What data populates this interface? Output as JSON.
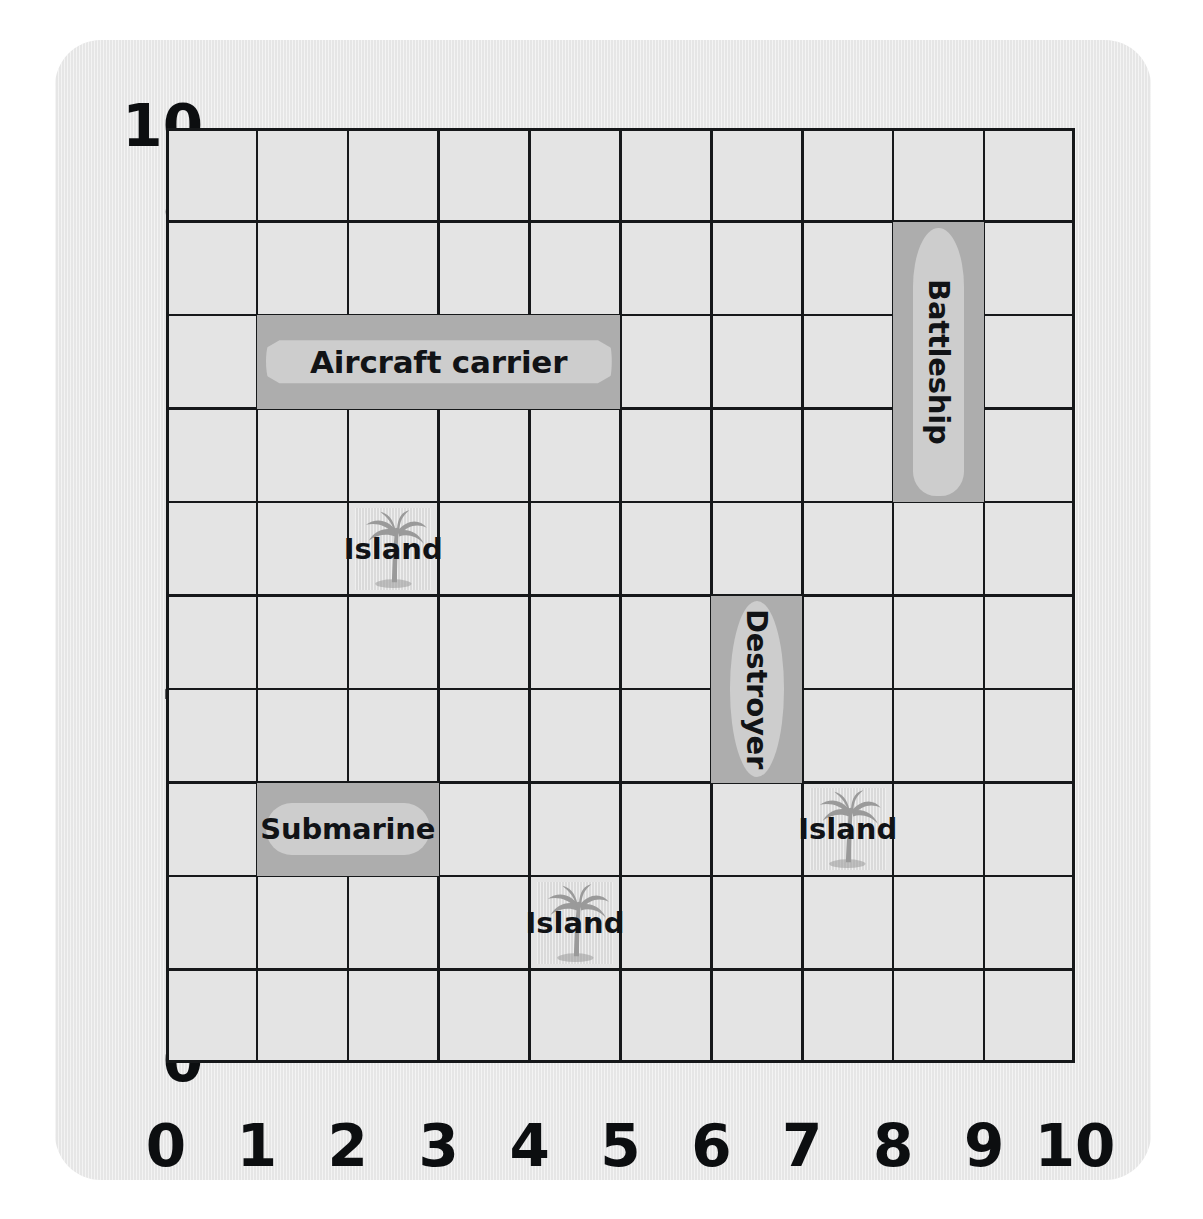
{
  "board": {
    "title": "Battleship coordinate grid",
    "grid_size": 10,
    "x_axis": {
      "label": "",
      "ticks": [
        "0",
        "1",
        "2",
        "3",
        "4",
        "5",
        "6",
        "7",
        "8",
        "9",
        "10"
      ]
    },
    "y_axis": {
      "label": "",
      "ticks": [
        "0",
        "1",
        "2",
        "3",
        "4",
        "5",
        "6",
        "7",
        "8",
        "9",
        "10"
      ]
    },
    "colors": {
      "page_background": "#ffffff",
      "card_background": "#e6e6e6",
      "grid_cell": "#e4e4e4",
      "grid_line": "#16181a",
      "ship_cell": "#adadad",
      "ship_hull": "#cdcdcd",
      "island_cell": "#dedede",
      "palm_tree": "#9a9a9a",
      "text": "#111316"
    }
  },
  "chart_data": {
    "type": "table",
    "xlabel": "",
    "ylabel": "",
    "xlim": [
      0,
      10
    ],
    "ylim": [
      0,
      10
    ],
    "grid": true,
    "legend": "none",
    "ships": [
      {
        "name": "Aircraft carrier",
        "orientation": "horizontal",
        "x_start": 1,
        "x_end": 5,
        "y_start": 7,
        "y_end": 8,
        "length_cells": 4,
        "cells": [
          "(1,7)",
          "(2,7)",
          "(3,7)",
          "(4,7)"
        ]
      },
      {
        "name": "Battleship",
        "orientation": "vertical",
        "x_start": 8,
        "x_end": 9,
        "y_start": 6,
        "y_end": 9,
        "length_cells": 3,
        "cells": [
          "(8,6)",
          "(8,7)",
          "(8,8)"
        ]
      },
      {
        "name": "Destroyer",
        "orientation": "vertical",
        "x_start": 6,
        "x_end": 7,
        "y_start": 3,
        "y_end": 5,
        "length_cells": 2,
        "cells": [
          "(6,3)",
          "(6,4)"
        ]
      },
      {
        "name": "Submarine",
        "orientation": "horizontal",
        "x_start": 1,
        "x_end": 3,
        "y_start": 2,
        "y_end": 3,
        "length_cells": 2,
        "cells": [
          "(1,2)",
          "(2,2)"
        ]
      }
    ],
    "islands": [
      {
        "name": "Island",
        "x_start": 2,
        "x_end": 3,
        "y_start": 5,
        "y_end": 6,
        "cells": [
          "(2,5)"
        ]
      },
      {
        "name": "Island",
        "x_start": 7,
        "x_end": 8,
        "y_start": 2,
        "y_end": 3,
        "cells": [
          "(7,2)"
        ]
      },
      {
        "name": "Island",
        "x_start": 4,
        "x_end": 5,
        "y_start": 1,
        "y_end": 2,
        "cells": [
          "(4,1)"
        ]
      }
    ]
  }
}
